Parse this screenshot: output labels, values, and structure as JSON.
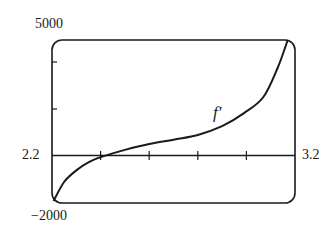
{
  "chart_data": {
    "type": "line",
    "title": "",
    "xlabel": "",
    "ylabel": "",
    "xlim": [
      2.2,
      3.2
    ],
    "ylim": [
      -2000,
      5000
    ],
    "x_tick_labels": [
      "2.2",
      "3.2"
    ],
    "y_tick_labels": [
      "5000",
      "-2000"
    ],
    "x_ticks": [
      2.4,
      2.6,
      2.8,
      3.0
    ],
    "y_ticks": [
      2000,
      4000
    ],
    "grid": false,
    "series": [
      {
        "name": "f'",
        "x": [
          2.2,
          2.25,
          2.3,
          2.35,
          2.41,
          2.5,
          2.6,
          2.7,
          2.8,
          2.9,
          2.99,
          3.07,
          3.13,
          3.17
        ],
        "values": [
          -2000,
          -1100,
          -600,
          -250,
          0,
          280,
          530,
          720,
          920,
          1300,
          1860,
          2550,
          3840,
          5000
        ]
      }
    ],
    "annotations": [
      {
        "text": "f'",
        "x": 2.96,
        "y": 2200
      }
    ]
  },
  "labels": {
    "ymax": "5000",
    "ymin": "−2000",
    "xmin": "2.2",
    "xmax": "3.2",
    "curve": "f′"
  }
}
